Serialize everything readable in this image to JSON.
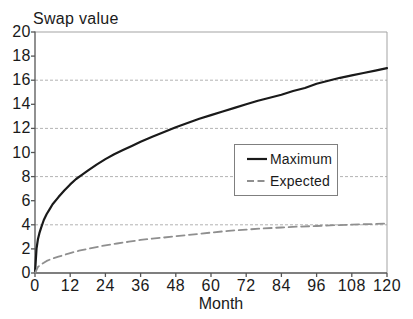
{
  "chart_data": {
    "type": "line",
    "y_axis_title": "Swap value",
    "x_axis_title": "Month",
    "xlim": [
      0,
      120
    ],
    "ylim": [
      0,
      20
    ],
    "x_ticks": [
      0,
      12,
      24,
      36,
      48,
      60,
      72,
      84,
      96,
      108,
      120
    ],
    "y_ticks": [
      0,
      2,
      4,
      6,
      8,
      10,
      12,
      14,
      16,
      18,
      20
    ],
    "gridlines_y": [
      4,
      8,
      12,
      16
    ],
    "grid_style": "horizontal dashed light-gray",
    "legend_position": "inside right-center, boxed",
    "series": [
      {
        "name": "Maximum",
        "style": "solid",
        "color": "#1a1a1a",
        "width": 2.2,
        "dash": "",
        "points": [
          [
            0,
            0
          ],
          [
            0.5,
            2.0
          ],
          [
            1,
            2.8
          ],
          [
            1.5,
            3.3
          ],
          [
            2,
            3.7
          ],
          [
            3,
            4.4
          ],
          [
            4,
            4.9
          ],
          [
            5,
            5.3
          ],
          [
            6,
            5.7
          ],
          [
            8,
            6.3
          ],
          [
            10,
            6.85
          ],
          [
            12,
            7.35
          ],
          [
            14,
            7.8
          ],
          [
            16,
            8.15
          ],
          [
            18,
            8.5
          ],
          [
            21,
            9.0
          ],
          [
            24,
            9.45
          ],
          [
            27,
            9.85
          ],
          [
            30,
            10.2
          ],
          [
            33,
            10.55
          ],
          [
            36,
            10.9
          ],
          [
            40,
            11.3
          ],
          [
            44,
            11.7
          ],
          [
            48,
            12.1
          ],
          [
            52,
            12.45
          ],
          [
            56,
            12.8
          ],
          [
            60,
            13.1
          ],
          [
            64,
            13.4
          ],
          [
            68,
            13.7
          ],
          [
            72,
            14.0
          ],
          [
            76,
            14.3
          ],
          [
            80,
            14.55
          ],
          [
            84,
            14.8
          ],
          [
            88,
            15.1
          ],
          [
            92,
            15.35
          ],
          [
            96,
            15.7
          ],
          [
            100,
            15.95
          ],
          [
            104,
            16.2
          ],
          [
            108,
            16.4
          ],
          [
            112,
            16.6
          ],
          [
            116,
            16.8
          ],
          [
            120,
            17.0
          ]
        ]
      },
      {
        "name": "Expected",
        "style": "dashed",
        "color": "#8f8f8f",
        "width": 1.8,
        "dash": "8 4.5",
        "points": [
          [
            0,
            0
          ],
          [
            1,
            0.5
          ],
          [
            2,
            0.7
          ],
          [
            3,
            0.85
          ],
          [
            4,
            1.0
          ],
          [
            6,
            1.2
          ],
          [
            8,
            1.35
          ],
          [
            10,
            1.5
          ],
          [
            12,
            1.65
          ],
          [
            15,
            1.85
          ],
          [
            18,
            2.0
          ],
          [
            21,
            2.15
          ],
          [
            24,
            2.3
          ],
          [
            28,
            2.45
          ],
          [
            32,
            2.6
          ],
          [
            36,
            2.75
          ],
          [
            40,
            2.85
          ],
          [
            44,
            2.95
          ],
          [
            48,
            3.05
          ],
          [
            52,
            3.15
          ],
          [
            56,
            3.25
          ],
          [
            60,
            3.35
          ],
          [
            66,
            3.5
          ],
          [
            72,
            3.6
          ],
          [
            78,
            3.7
          ],
          [
            84,
            3.78
          ],
          [
            90,
            3.85
          ],
          [
            96,
            3.9
          ],
          [
            102,
            3.97
          ],
          [
            108,
            4.02
          ],
          [
            114,
            4.06
          ],
          [
            120,
            4.1
          ]
        ]
      }
    ],
    "colors": {
      "background": "#ffffff",
      "axis": "#555555",
      "plot_border": "#a3a3a3",
      "gridline": "#b3b3b3",
      "text": "#1a1a1a",
      "legend_border": "#7f7f7f"
    }
  }
}
